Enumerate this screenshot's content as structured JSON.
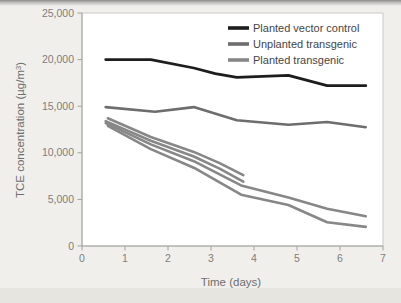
{
  "page": {
    "background_color": "#f0efec",
    "top_edge_color": "#8a8a8a",
    "bottom_band_color": "#e7e5e0",
    "plot_background": "#ffffff",
    "frame_border_color": "#cbcac7",
    "axis_color": "#a2a2a0",
    "tick_label_color": "#7e7e7c",
    "axis_title_color": "#6e6e6c",
    "legend_text_color": "#454545"
  },
  "chart_data": {
    "type": "line",
    "title": "",
    "xlabel": "Time (days)",
    "ylabel": {
      "text": "TCE concentration (µg/m³)",
      "prefix": "TCE concentration (µg/m",
      "superscript": "3",
      "suffix": ")"
    },
    "xlim": [
      0,
      7
    ],
    "ylim": [
      0,
      25000
    ],
    "x_ticks": [
      0,
      1,
      2,
      3,
      4,
      5,
      6,
      7
    ],
    "y_ticks": [
      0,
      5000,
      10000,
      15000,
      20000,
      25000
    ],
    "y_tick_labels": [
      "0",
      "5,000",
      "10,000",
      "15,000",
      "20,000",
      "25,000"
    ],
    "grid": false,
    "legend": {
      "position": "top-right",
      "entries": [
        {
          "label": "Planted vector control",
          "color": "#1d1d1d"
        },
        {
          "label": "Unplanted transgenic",
          "color": "#6d6d6d"
        },
        {
          "label": "Planted transgenic",
          "color": "#878787"
        }
      ]
    },
    "series": [
      {
        "name": "Planted vector control",
        "color": "#1d1d1d",
        "width": 2.8,
        "points": [
          [
            0.55,
            20000
          ],
          [
            1.6,
            20000
          ],
          [
            2.6,
            19100
          ],
          [
            3.1,
            18500
          ],
          [
            3.6,
            18100
          ],
          [
            4.8,
            18300
          ],
          [
            5.7,
            17200
          ],
          [
            6.6,
            17200
          ]
        ]
      },
      {
        "name": "Unplanted transgenic",
        "color": "#6d6d6d",
        "width": 2.6,
        "points": [
          [
            0.55,
            14900
          ],
          [
            1.7,
            14400
          ],
          [
            2.6,
            14900
          ],
          [
            3.6,
            13500
          ],
          [
            4.8,
            13000
          ],
          [
            5.7,
            13300
          ],
          [
            6.6,
            12750
          ]
        ]
      },
      {
        "name": "Planted transgenic (replicate 1)",
        "color": "#878787",
        "width": 2.6,
        "points": [
          [
            0.6,
            13700
          ],
          [
            1.6,
            11700
          ],
          [
            2.6,
            10100
          ],
          [
            3.2,
            8900
          ],
          [
            3.75,
            7600
          ]
        ]
      },
      {
        "name": "Planted transgenic (replicate 2)",
        "color": "#878787",
        "width": 2.6,
        "points": [
          [
            0.55,
            13400
          ],
          [
            1.6,
            11300
          ],
          [
            2.6,
            9600
          ],
          [
            3.2,
            8300
          ],
          [
            3.75,
            6900
          ]
        ]
      },
      {
        "name": "Planted transgenic (replicate 3)",
        "color": "#878787",
        "width": 2.6,
        "points": [
          [
            0.55,
            13200
          ],
          [
            1.6,
            10900
          ],
          [
            2.6,
            9100
          ],
          [
            3.7,
            6500
          ],
          [
            4.8,
            5200
          ],
          [
            5.7,
            4000
          ],
          [
            6.6,
            3200
          ]
        ]
      },
      {
        "name": "Planted transgenic (replicate 4)",
        "color": "#878787",
        "width": 2.6,
        "points": [
          [
            0.6,
            12900
          ],
          [
            1.6,
            10400
          ],
          [
            2.6,
            8400
          ],
          [
            3.7,
            5500
          ],
          [
            4.8,
            4400
          ],
          [
            5.7,
            2550
          ],
          [
            6.6,
            2050
          ]
        ]
      }
    ],
    "layout": {
      "plot_left": 82,
      "plot_right": 383,
      "plot_top": 13,
      "plot_bottom": 246,
      "legend_x": 228,
      "legend_y": 28,
      "legend_row_height": 16,
      "legend_swatch_length": 21
    }
  }
}
